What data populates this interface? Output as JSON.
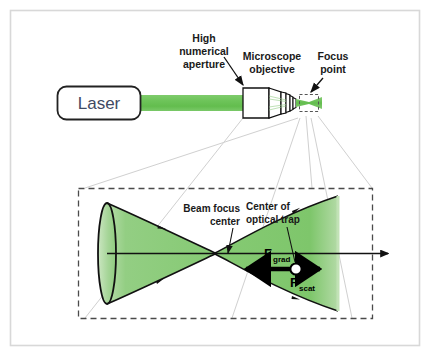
{
  "figure": {
    "background_color": "#ffffff",
    "border_color": "#d8d8d8"
  },
  "colors": {
    "beam_green": "#6ec45a",
    "cone_green_light": "#8ecb7e",
    "cone_green_mid": "#7cc466",
    "cone_edge_pale": "#b9ddac",
    "outline_black": "#111111",
    "label_text": "#1a1a1a",
    "laser_text": "#3f4a63",
    "projection_line": "#cfcfcf",
    "dashed_border": "#4a4a4a"
  },
  "upper_diagram": {
    "laser": {
      "label": "Laser",
      "shape": "rounded-rectangle"
    },
    "beam": {
      "name": "collimated-laser-beam",
      "color": "#6ec45a"
    },
    "objective": {
      "name": "microscope-objective",
      "label": "Microscope objective",
      "label_line1": "Microscope",
      "label_line2": "objective"
    },
    "numerical_aperture": {
      "label": "High numerical aperture",
      "label_line1": "High",
      "label_line2": "numerical",
      "label_line3": "aperture"
    },
    "focus_point": {
      "label": "Focus point",
      "label_line1": "Focus",
      "label_line2": "point"
    }
  },
  "magnified_view": {
    "beam_focus_center": {
      "label": "Beam focus center",
      "label_line1": "Beam focus",
      "label_line2": "center"
    },
    "optical_trap_center": {
      "label": "Center of optical trap",
      "label_line1": "Center of",
      "label_line2": "optical trap"
    },
    "forces": [
      {
        "symbol": "F",
        "subscript": "grad",
        "full_label": "F_grad",
        "direction": "left",
        "description": "gradient force"
      },
      {
        "symbol": "F",
        "subscript": "scat",
        "full_label": "F_scat",
        "direction": "right",
        "description": "scattering force"
      }
    ],
    "trapped_particle": {
      "name": "trapped-bead",
      "fill": "#ffffff",
      "stroke": "#000000"
    }
  }
}
